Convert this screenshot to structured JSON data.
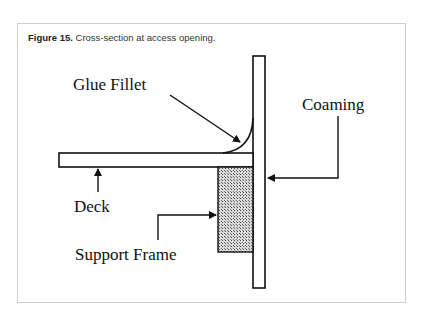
{
  "figure": {
    "number_label": "Figure 15.",
    "caption": " Cross-section at access opening."
  },
  "diagram": {
    "labels": {
      "glue_fillet": "Glue Fillet",
      "coaming": "Coaming",
      "deck": "Deck",
      "support_frame": "Support Frame"
    },
    "colors": {
      "stroke": "#111111",
      "hatch": "#888888",
      "frame_border": "#cfcfcf"
    }
  }
}
